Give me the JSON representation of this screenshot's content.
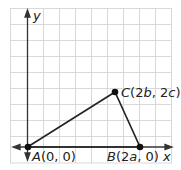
{
  "diagram": {
    "type": "coordinate-plane-triangle",
    "axes": {
      "x_label": "x",
      "y_label": "y"
    },
    "points": [
      {
        "name": "A",
        "coords": "(0, 0)",
        "label_prefix": "A(",
        "label_a": "0",
        "label_sep": ", ",
        "label_b": "0",
        "label_suffix": ")"
      },
      {
        "name": "B",
        "coords": "(2a, 0)",
        "label_prefix": "B(",
        "label_a": "2a",
        "label_sep": ", ",
        "label_b": "0",
        "label_suffix": ")"
      },
      {
        "name": "C",
        "coords": "(2b, 2c)",
        "label_prefix": "C(",
        "label_a": "2b",
        "label_sep": ", ",
        "label_b": "2c",
        "label_suffix": ")"
      }
    ],
    "colors": {
      "grid": "#d9d9d9",
      "axis": "#333333",
      "triangle": "#222222",
      "point": "#111111"
    }
  }
}
